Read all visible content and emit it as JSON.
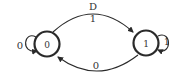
{
  "diagram": {
    "type": "state-transition",
    "states": [
      {
        "id": "s0",
        "label": "0"
      },
      {
        "id": "s1",
        "label": "1"
      }
    ],
    "transitions": [
      {
        "from": "s0",
        "to": "s1",
        "label": "1",
        "top_annotation": "D"
      },
      {
        "from": "s1",
        "to": "s0",
        "label": "0"
      },
      {
        "from": "s0",
        "to": "s0",
        "label": "0"
      },
      {
        "from": "s1",
        "to": "s1",
        "label": "1"
      }
    ],
    "colors": {
      "stroke": "#2a2a2a",
      "text": "#333333",
      "background": "#ffffff"
    }
  }
}
